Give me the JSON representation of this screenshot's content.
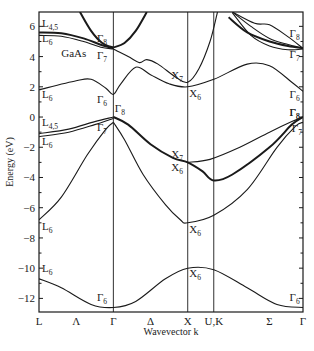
{
  "chart_data": {
    "type": "line",
    "title": "GaAs",
    "xlabel": "Wavevector k",
    "ylabel": "Energy (eV)",
    "ylim": [
      -12.9,
      6.95
    ],
    "yticks": [
      6,
      4,
      2,
      0,
      -2,
      -4,
      -6,
      -8,
      -10,
      -12
    ],
    "xticks": [
      {
        "label": "L",
        "pos": 0.0
      },
      {
        "label": "Λ",
        "pos": 0.5
      },
      {
        "label": "Γ",
        "pos": 1.0
      },
      {
        "label": "Δ",
        "pos": 1.5
      },
      {
        "label": "X",
        "pos": 2.0
      },
      {
        "label": "U,K",
        "pos": 2.35
      },
      {
        "label": "Σ",
        "pos": 3.1
      },
      {
        "label": "Γ",
        "pos": 3.55
      }
    ],
    "vertical_lines": [
      1.0,
      2.0,
      2.35
    ],
    "xlim": [
      0,
      3.55
    ],
    "grid": false,
    "series": [
      {
        "name": "L4,5 upper conduction",
        "thick": true,
        "points": [
          [
            0,
            5.6
          ],
          [
            0.3,
            5.55
          ],
          [
            0.6,
            5.2
          ],
          [
            0.85,
            4.75
          ],
          [
            1.0,
            4.55
          ]
        ]
      },
      {
        "name": "L6 upper conduction",
        "thick": false,
        "points": [
          [
            0,
            5.4
          ],
          [
            0.3,
            5.35
          ],
          [
            0.6,
            5.0
          ],
          [
            0.85,
            4.6
          ],
          [
            1.0,
            4.5
          ]
        ]
      },
      {
        "name": "Gamma8 upward parabola left",
        "thick": true,
        "points": [
          [
            1.0,
            4.6
          ],
          [
            0.85,
            4.9
          ],
          [
            0.7,
            5.7
          ],
          [
            0.55,
            6.95
          ]
        ]
      },
      {
        "name": "Gamma8 upward parabola right",
        "thick": true,
        "points": [
          [
            1.0,
            4.6
          ],
          [
            1.15,
            4.9
          ],
          [
            1.3,
            5.7
          ],
          [
            1.45,
            6.95
          ]
        ]
      },
      {
        "name": "Gamma7 to X7 conduction",
        "thick": false,
        "points": [
          [
            1.0,
            4.5
          ],
          [
            1.2,
            4.0
          ],
          [
            1.35,
            3.6
          ],
          [
            1.45,
            3.8
          ],
          [
            1.6,
            3.5
          ],
          [
            1.85,
            2.6
          ],
          [
            2.0,
            2.3
          ],
          [
            2.15,
            3.2
          ],
          [
            2.3,
            5.0
          ],
          [
            2.4,
            6.95
          ]
        ]
      },
      {
        "name": "lowest conduction",
        "thick": false,
        "points": [
          [
            0,
            1.8
          ],
          [
            0.5,
            2.4
          ],
          [
            0.7,
            2.5
          ],
          [
            0.9,
            1.9
          ],
          [
            1.0,
            1.5
          ],
          [
            1.1,
            2.2
          ],
          [
            1.3,
            3.3
          ],
          [
            1.5,
            2.8
          ],
          [
            1.75,
            2.2
          ],
          [
            2.0,
            2.0
          ],
          [
            2.35,
            2.5
          ],
          [
            2.8,
            3.5
          ],
          [
            3.1,
            3.4
          ],
          [
            3.4,
            2.3
          ],
          [
            3.55,
            1.7
          ]
        ]
      },
      {
        "name": "Sigma upper band 1",
        "thick": false,
        "points": [
          [
            2.6,
            6.95
          ],
          [
            2.9,
            6.2
          ],
          [
            3.1,
            6.1
          ],
          [
            3.35,
            5.3
          ],
          [
            3.55,
            4.55
          ]
        ]
      },
      {
        "name": "Sigma upper band 2",
        "thick": true,
        "points": [
          [
            2.55,
            6.6
          ],
          [
            2.8,
            5.6
          ],
          [
            3.1,
            5.0
          ],
          [
            3.35,
            4.7
          ],
          [
            3.55,
            4.55
          ]
        ]
      },
      {
        "name": "Sigma upper band 3",
        "thick": false,
        "points": [
          [
            2.6,
            6.95
          ],
          [
            2.85,
            6.0
          ],
          [
            3.1,
            5.2
          ],
          [
            3.35,
            4.8
          ],
          [
            3.55,
            4.55
          ]
        ]
      },
      {
        "name": "Sigma upper band 4",
        "thick": false,
        "points": [
          [
            2.6,
            6.9
          ],
          [
            2.85,
            5.4
          ],
          [
            3.1,
            4.7
          ],
          [
            3.35,
            4.45
          ],
          [
            3.55,
            4.5
          ]
        ]
      },
      {
        "name": "L4,5 valence",
        "thick": false,
        "points": [
          [
            0,
            -1.1
          ],
          [
            0.4,
            -0.8
          ],
          [
            0.75,
            -0.3
          ],
          [
            1.0,
            0.0
          ]
        ]
      },
      {
        "name": "L6 valence",
        "thick": false,
        "points": [
          [
            0,
            -1.3
          ],
          [
            0.4,
            -1.0
          ],
          [
            0.75,
            -0.5
          ],
          [
            1.0,
            -0.1
          ]
        ]
      },
      {
        "name": "heavy hole Gamma8 to X7",
        "thick": true,
        "points": [
          [
            1.0,
            0.0
          ],
          [
            1.2,
            -0.5
          ],
          [
            1.5,
            -1.8
          ],
          [
            1.8,
            -2.7
          ],
          [
            2.0,
            -3.0
          ],
          [
            2.2,
            -3.6
          ],
          [
            2.35,
            -4.2
          ],
          [
            2.6,
            -3.8
          ],
          [
            3.1,
            -2.0
          ],
          [
            3.4,
            -0.5
          ],
          [
            3.55,
            0.0
          ]
        ]
      },
      {
        "name": "light hole X7 to Gamma",
        "thick": false,
        "points": [
          [
            2.0,
            -3.0
          ],
          [
            2.3,
            -2.8
          ],
          [
            2.7,
            -2.0
          ],
          [
            3.1,
            -1.0
          ],
          [
            3.4,
            -0.3
          ],
          [
            3.55,
            0.0
          ]
        ]
      },
      {
        "name": "split-off Gamma7 to X6",
        "thick": false,
        "points": [
          [
            1.0,
            -0.35
          ],
          [
            1.15,
            -1.5
          ],
          [
            1.4,
            -3.8
          ],
          [
            1.7,
            -5.8
          ],
          [
            1.9,
            -6.8
          ],
          [
            2.0,
            -7.0
          ],
          [
            2.35,
            -6.5
          ],
          [
            2.8,
            -4.8
          ],
          [
            3.2,
            -2.0
          ],
          [
            3.45,
            -0.6
          ],
          [
            3.55,
            -0.35
          ]
        ]
      },
      {
        "name": "L6 lower valence",
        "thick": false,
        "points": [
          [
            0,
            -6.8
          ],
          [
            0.3,
            -5.3
          ],
          [
            0.65,
            -2.5
          ],
          [
            0.9,
            -0.8
          ],
          [
            1.0,
            -0.35
          ]
        ]
      },
      {
        "name": "lowest valence",
        "thick": false,
        "points": [
          [
            0,
            -10.7
          ],
          [
            0.3,
            -11.3
          ],
          [
            0.7,
            -12.4
          ],
          [
            1.0,
            -12.6
          ],
          [
            1.3,
            -12.2
          ],
          [
            1.7,
            -10.7
          ],
          [
            2.0,
            -10.0
          ],
          [
            2.35,
            -10.1
          ],
          [
            2.8,
            -11.3
          ],
          [
            3.2,
            -12.4
          ],
          [
            3.55,
            -12.6
          ]
        ]
      }
    ],
    "annotations": [
      {
        "base": "L",
        "sub": "4,5",
        "x": 0.04,
        "y": 5.95
      },
      {
        "base": "L",
        "sub": "6",
        "x": 0.04,
        "y": 4.95
      },
      {
        "base": "Γ",
        "sub": "8",
        "x": 0.78,
        "y": 4.95
      },
      {
        "base": "Γ",
        "sub": "7",
        "x": 0.78,
        "y": 3.85
      },
      {
        "base": "Γ",
        "sub": "6",
        "x": 0.78,
        "y": 0.95
      },
      {
        "base": "L",
        "sub": "6",
        "x": 0.04,
        "y": 1.25
      },
      {
        "base": "X",
        "sub": "7",
        "x": 1.78,
        "y": 2.5
      },
      {
        "base": "X",
        "sub": "6",
        "x": 2.02,
        "y": 1.35
      },
      {
        "base": "Γ",
        "sub": "8",
        "x": 3.37,
        "y": 5.3
      },
      {
        "base": "Γ",
        "sub": "7",
        "x": 3.37,
        "y": 3.9
      },
      {
        "base": "Γ",
        "sub": "6",
        "x": 3.37,
        "y": 1.25
      },
      {
        "base": "Γ",
        "sub": "8",
        "x": 3.37,
        "y": 0.1
      },
      {
        "base": "Γ",
        "sub": "8",
        "x": 1.02,
        "y": 0.35
      },
      {
        "base": "L",
        "sub": "4,5",
        "x": 0.04,
        "y": -0.6
      },
      {
        "base": "L",
        "sub": "6",
        "x": 0.04,
        "y": -1.85
      },
      {
        "base": "Γ",
        "sub": "7",
        "x": 0.78,
        "y": -0.95
      },
      {
        "base": "X",
        "sub": "7",
        "x": 1.78,
        "y": -2.7
      },
      {
        "base": "X",
        "sub": "6",
        "x": 1.78,
        "y": -3.6
      },
      {
        "base": "Γ",
        "sub": "8",
        "x": 3.37,
        "y": 0.1
      },
      {
        "base": "Γ",
        "sub": "7",
        "x": 3.4,
        "y": -1.0
      },
      {
        "base": "L",
        "sub": "6",
        "x": 0.04,
        "y": -7.45
      },
      {
        "base": "X",
        "sub": "6",
        "x": 2.02,
        "y": -7.65
      },
      {
        "base": "L",
        "sub": "6",
        "x": 0.04,
        "y": -10.25
      },
      {
        "base": "X",
        "sub": "6",
        "x": 2.02,
        "y": -10.6
      },
      {
        "base": "Γ",
        "sub": "6",
        "x": 0.78,
        "y": -12.2
      },
      {
        "base": "Γ",
        "sub": "6",
        "x": 3.37,
        "y": -12.2
      }
    ],
    "material_label": {
      "text": "GaAs",
      "x": 0.3,
      "y": 4.0
    }
  }
}
